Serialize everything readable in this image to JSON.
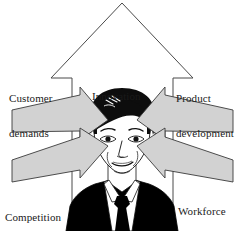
{
  "diagram": {
    "center_subject": "businessman-portrait",
    "background_color": "#ffffff",
    "arrow_fill_gray": "#d2d2d2",
    "arrow_outline_color": "#333333",
    "big_arrow_fill": "#ffffff",
    "big_arrow_outline": "#444444",
    "text_color": "#1a1a1a",
    "labels": {
      "innovation": "Innovation",
      "customer_demands_line1": "Customer",
      "customer_demands_line2": "demands",
      "product_development_line1": "Product",
      "product_development_line2": "development",
      "competition": "Competition",
      "workforce_practice_line1": "Workforce",
      "workforce_practice_line2": "practice"
    },
    "arrows": [
      {
        "name": "innovation-up-arrow",
        "direction": "up",
        "style": "outline",
        "label": "Innovation"
      },
      {
        "name": "customer-demands-arrow",
        "direction": "down-right",
        "style": "filled-gray",
        "label": "Customer demands"
      },
      {
        "name": "product-development-arrow",
        "direction": "down-left",
        "style": "filled-gray",
        "label": "Product development"
      },
      {
        "name": "competition-arrow",
        "direction": "up-right",
        "style": "filled-gray",
        "label": "Competition"
      },
      {
        "name": "workforce-practice-arrow",
        "direction": "up-left",
        "style": "filled-gray",
        "label": "Workforce practice"
      }
    ],
    "portrait": {
      "hair_color": "#0d0d0d",
      "skin_color": "#ffffff",
      "suit_color": "#000000",
      "shirt_color": "#ffffff",
      "tie_color": "#000000"
    }
  }
}
